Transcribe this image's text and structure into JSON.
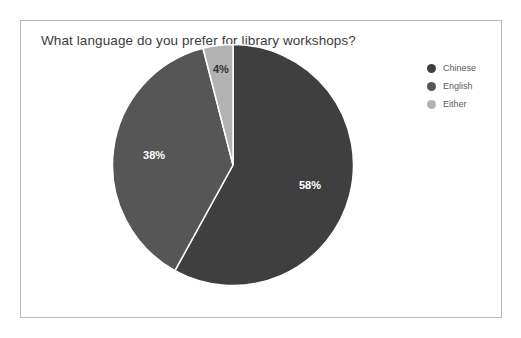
{
  "frame": {
    "border_color": "#b9b9b9",
    "background": "#ffffff"
  },
  "chart_data": {
    "type": "pie",
    "title": "What language do you prefer for library workshops?",
    "categories": [
      "Chinese",
      "English",
      "Either"
    ],
    "values": [
      58,
      38,
      4
    ],
    "labels": [
      "58%",
      "38%",
      "4%"
    ],
    "colors": [
      "#3f3f3f",
      "#565656",
      "#b2b2b2"
    ],
    "label_colors": [
      "#ffffff",
      "#ffffff",
      "#333333"
    ],
    "start_angle_deg": 0,
    "direction": "clockwise",
    "legend_position": "right",
    "grid": false,
    "xlabel": "",
    "ylabel": ""
  },
  "legend": {
    "items": [
      {
        "label": "Chinese",
        "color": "#3f3f3f"
      },
      {
        "label": "English",
        "color": "#565656"
      },
      {
        "label": "Either",
        "color": "#b2b2b2"
      }
    ]
  }
}
